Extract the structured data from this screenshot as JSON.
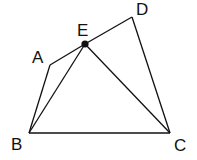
{
  "diagram": {
    "type": "geometry",
    "stroke_color": "#111111",
    "background": "#ffffff",
    "points": {
      "A": {
        "label": "A",
        "x": 50,
        "y": 65,
        "label_x": 32,
        "label_y": 63
      },
      "B": {
        "label": "B",
        "x": 29,
        "y": 133,
        "label_x": 11,
        "label_y": 150
      },
      "C": {
        "label": "C",
        "x": 170,
        "y": 133,
        "label_x": 174,
        "label_y": 151
      },
      "D": {
        "label": "D",
        "x": 132,
        "y": 17,
        "label_x": 136,
        "label_y": 15
      },
      "E": {
        "label": "E",
        "x": 85,
        "y": 44,
        "label_x": 77,
        "label_y": 36
      }
    },
    "segments": [
      [
        "A",
        "E"
      ],
      [
        "E",
        "D"
      ],
      [
        "D",
        "C"
      ],
      [
        "C",
        "B"
      ],
      [
        "B",
        "A"
      ],
      [
        "B",
        "E"
      ],
      [
        "E",
        "C"
      ]
    ],
    "marked_point": "E"
  }
}
